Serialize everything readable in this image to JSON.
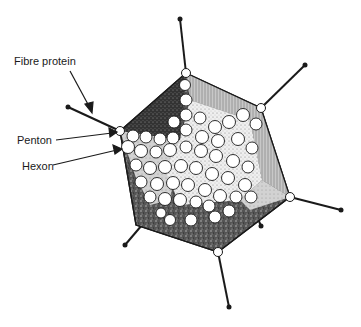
{
  "diagram": {
    "labels": {
      "fibre": "Fibre protein",
      "penton": "Penton",
      "hexon": "Hexon"
    },
    "colors": {
      "outline": "#1a1a1a",
      "dark_face": "#2a2a2a",
      "mid_face": "#9a9a9a",
      "light_face": "#d6d6d6",
      "center_face": "#ececec",
      "capsomer_fill": "#ffffff"
    }
  }
}
